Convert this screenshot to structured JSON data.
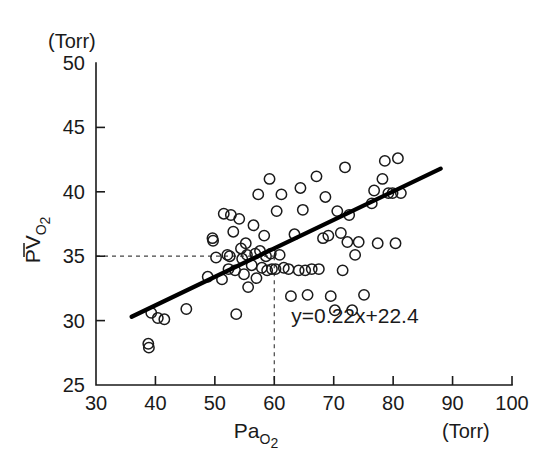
{
  "figure": {
    "background": "#ffffff",
    "ink_color": "#1a1a1a",
    "y_unit_label": "(Torr)",
    "x_unit_label": "(Torr)",
    "y_axis_title_main": "PV",
    "y_axis_title_sub": "O",
    "y_axis_title_sub2": "2",
    "x_axis_title_main": "Pa",
    "x_axis_title_sub": "O",
    "x_axis_title_sub2": "2",
    "equation": "y=0.22x+22.4"
  },
  "chart_data": {
    "type": "scatter",
    "title": "",
    "xlabel": "PaO2",
    "ylabel": "PvO2",
    "xunit": "Torr",
    "yunit": "Torr",
    "xlim": [
      30,
      100
    ],
    "ylim": [
      25,
      50
    ],
    "xticks": [
      30,
      40,
      50,
      60,
      70,
      80,
      90,
      100
    ],
    "yticks": [
      25,
      30,
      35,
      40,
      45,
      50
    ],
    "xtick_labels": [
      "30",
      "40",
      "50",
      "60",
      "70",
      "80",
      "90",
      "100"
    ],
    "ytick_labels": [
      "25",
      "30",
      "35",
      "40",
      "45",
      "50"
    ],
    "grid": false,
    "legend": null,
    "marker": "open-circle",
    "regression": {
      "equation_text": "y=0.22x+22.4",
      "slope": 0.22,
      "intercept": 22.4,
      "x_start": 36.0,
      "x_end": 88.0,
      "y_start": 30.3,
      "y_end": 41.8
    },
    "guides": {
      "x_value": 60,
      "y_value": 35,
      "style": "dashed"
    },
    "points": [
      [
        38.8,
        28.2
      ],
      [
        38.9,
        27.9
      ],
      [
        39.3,
        30.6
      ],
      [
        40.4,
        30.2
      ],
      [
        41.5,
        30.1
      ],
      [
        45.2,
        30.9
      ],
      [
        48.8,
        33.4
      ],
      [
        49.6,
        36.4
      ],
      [
        49.7,
        36.2
      ],
      [
        50.2,
        34.9
      ],
      [
        51.2,
        33.2
      ],
      [
        51.5,
        38.3
      ],
      [
        52.1,
        35.1
      ],
      [
        52.3,
        34.0
      ],
      [
        52.5,
        35.0
      ],
      [
        52.7,
        38.2
      ],
      [
        53.1,
        36.9
      ],
      [
        53.4,
        33.9
      ],
      [
        53.6,
        30.5
      ],
      [
        54.1,
        37.9
      ],
      [
        54.4,
        35.6
      ],
      [
        54.6,
        34.8
      ],
      [
        54.9,
        33.6
      ],
      [
        55.2,
        36.0
      ],
      [
        55.4,
        35.1
      ],
      [
        55.6,
        32.6
      ],
      [
        56.2,
        34.3
      ],
      [
        56.5,
        37.4
      ],
      [
        56.8,
        35.2
      ],
      [
        57.0,
        33.3
      ],
      [
        57.3,
        39.8
      ],
      [
        57.6,
        35.4
      ],
      [
        57.9,
        34.1
      ],
      [
        58.3,
        36.6
      ],
      [
        58.6,
        35.0
      ],
      [
        58.8,
        33.9
      ],
      [
        59.2,
        41.0
      ],
      [
        59.4,
        35.2
      ],
      [
        59.6,
        34.0
      ],
      [
        60.2,
        34.0
      ],
      [
        60.4,
        38.5
      ],
      [
        60.9,
        35.1
      ],
      [
        61.2,
        39.8
      ],
      [
        61.6,
        34.1
      ],
      [
        62.4,
        34.0
      ],
      [
        62.8,
        31.9
      ],
      [
        63.4,
        36.7
      ],
      [
        64.1,
        33.9
      ],
      [
        64.4,
        40.3
      ],
      [
        64.8,
        38.6
      ],
      [
        65.2,
        33.9
      ],
      [
        65.6,
        32.0
      ],
      [
        66.3,
        34.0
      ],
      [
        67.1,
        41.2
      ],
      [
        67.5,
        34.0
      ],
      [
        68.2,
        36.4
      ],
      [
        68.6,
        39.6
      ],
      [
        69.1,
        36.6
      ],
      [
        69.5,
        31.9
      ],
      [
        70.2,
        30.8
      ],
      [
        70.6,
        38.5
      ],
      [
        71.2,
        36.8
      ],
      [
        71.5,
        33.9
      ],
      [
        71.9,
        41.9
      ],
      [
        72.3,
        36.1
      ],
      [
        72.6,
        38.2
      ],
      [
        73.1,
        30.8
      ],
      [
        73.6,
        35.1
      ],
      [
        74.2,
        36.1
      ],
      [
        75.1,
        32.0
      ],
      [
        76.4,
        39.1
      ],
      [
        76.8,
        40.1
      ],
      [
        77.4,
        36.0
      ],
      [
        78.2,
        41.0
      ],
      [
        78.6,
        42.4
      ],
      [
        79.2,
        39.9
      ],
      [
        79.9,
        39.9
      ],
      [
        80.4,
        36.0
      ],
      [
        80.8,
        42.6
      ],
      [
        81.3,
        39.9
      ]
    ]
  }
}
